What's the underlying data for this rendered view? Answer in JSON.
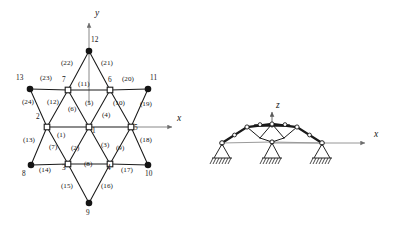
{
  "figure": {
    "title": "",
    "colors": {
      "line": "#1a1a1a",
      "node_fill_solid": "#141414",
      "node_fill_hollow": "#ffffff",
      "axis": "#6e6e6e",
      "background": "#ffffff"
    }
  },
  "left_diagram": {
    "name": "star-truss-plan-view",
    "axes": [
      {
        "id": "y-axis",
        "label": "y",
        "label_x": 96,
        "label_y": 14,
        "x1": 89,
        "y1": 105,
        "x2": 89,
        "y2": 22
      },
      {
        "id": "x-axis",
        "label": "x",
        "label_x": 180,
        "label_y": 120,
        "x1": 131,
        "y1": 127,
        "x2": 174,
        "y2": 127
      }
    ],
    "nodes": [
      {
        "id": "1",
        "x": 89,
        "y": 127,
        "type": "hollow",
        "label": "1",
        "label_x": 93,
        "label_y": 131
      },
      {
        "id": "2",
        "x": 47,
        "y": 127,
        "type": "hollow",
        "label": "2",
        "label_x": 38,
        "label_y": 119
      },
      {
        "id": "3",
        "x": 68,
        "y": 164,
        "type": "hollow",
        "label": "3",
        "label_x": 64,
        "label_y": 168
      },
      {
        "id": "4",
        "x": 110,
        "y": 164,
        "type": "hollow",
        "label": "4",
        "label_x": 109,
        "label_y": 168
      },
      {
        "id": "5",
        "x": 131,
        "y": 127,
        "type": "hollow",
        "label": "5",
        "label_x": 134,
        "label_y": 128
      },
      {
        "id": "6",
        "x": 110,
        "y": 90,
        "type": "hollow",
        "label": "6",
        "label_x": 110,
        "label_y": 80
      },
      {
        "id": "7",
        "x": 68,
        "y": 90,
        "type": "hollow",
        "label": "7",
        "label_x": 63,
        "label_y": 80
      },
      {
        "id": "8",
        "x": 31,
        "y": 165,
        "type": "solid",
        "label": "8",
        "label_x": 24,
        "label_y": 172
      },
      {
        "id": "9",
        "x": 89,
        "y": 203,
        "type": "solid",
        "label": "9",
        "label_x": 87,
        "label_y": 208
      },
      {
        "id": "10",
        "x": 148,
        "y": 165,
        "type": "solid",
        "label": "10",
        "label_x": 147,
        "label_y": 172
      },
      {
        "id": "11",
        "x": 148,
        "y": 89,
        "type": "solid",
        "label": "11",
        "label_x": 150,
        "label_y": 78
      },
      {
        "id": "12",
        "x": 89,
        "y": 51,
        "type": "solid",
        "label": "12",
        "label_x": 92,
        "label_y": 41
      },
      {
        "id": "13",
        "x": 30,
        "y": 89,
        "type": "solid",
        "label": "13",
        "label_x": 18,
        "label_y": 78
      }
    ],
    "members": [
      {
        "id": "1",
        "from": "1",
        "to": "2",
        "label": "(1)",
        "label_x": 60,
        "label_y": 132
      },
      {
        "id": "2",
        "from": "1",
        "to": "3",
        "label": "(2)",
        "label_x": 74,
        "label_y": 150
      },
      {
        "id": "3",
        "from": "1",
        "to": "4",
        "label": "(3)",
        "label_x": 104,
        "label_y": 147
      },
      {
        "id": "4",
        "from": "1",
        "to": "5",
        "label": "(4)",
        "label_x": 105,
        "label_y": 117
      },
      {
        "id": "5",
        "from": "1",
        "to": "6",
        "label": "(5)",
        "label_x": 88,
        "label_y": 105
      },
      {
        "id": "6",
        "from": "1",
        "to": "7",
        "label": "(6)",
        "label_x": 71,
        "label_y": 110
      },
      {
        "id": "7",
        "from": "2",
        "to": "3",
        "label": "(7)",
        "label_x": 52,
        "label_y": 148
      },
      {
        "id": "8",
        "from": "3",
        "to": "4",
        "label": "(8)",
        "label_x": 87,
        "label_y": 165
      },
      {
        "id": "9",
        "from": "4",
        "to": "5",
        "label": "(9)",
        "label_x": 119,
        "label_y": 150
      },
      {
        "id": "10",
        "from": "5",
        "to": "6",
        "label": "(10)",
        "label_x": 117,
        "label_y": 105
      },
      {
        "id": "11",
        "from": "6",
        "to": "7",
        "label": "(11)",
        "label_x": 82,
        "label_y": 85
      },
      {
        "id": "12",
        "from": "7",
        "to": "2",
        "label": "(12)",
        "label_x": 51,
        "label_y": 104
      },
      {
        "id": "13",
        "from": "2",
        "to": "8",
        "label": "(13)",
        "label_x": 27,
        "label_y": 141
      },
      {
        "id": "14",
        "from": "8",
        "to": "3",
        "label": "(14)",
        "label_x": 44,
        "label_y": 168
      },
      {
        "id": "15",
        "from": "3",
        "to": "9",
        "label": "(15)",
        "label_x": 66,
        "label_y": 186
      },
      {
        "id": "16",
        "from": "9",
        "to": "4",
        "label": "(16)",
        "label_x": 105,
        "label_y": 185
      },
      {
        "id": "17",
        "from": "4",
        "to": "10",
        "label": "(17)",
        "label_x": 126,
        "label_y": 168
      },
      {
        "id": "18",
        "from": "10",
        "to": "5",
        "label": "(18)",
        "label_x": 143,
        "label_y": 142
      },
      {
        "id": "19",
        "from": "5",
        "to": "11",
        "label": "(19)",
        "label_x": 143,
        "label_y": 106
      },
      {
        "id": "20",
        "from": "11",
        "to": "6",
        "label": "(20)",
        "label_x": 126,
        "label_y": 80
      },
      {
        "id": "21",
        "from": "6",
        "to": "12",
        "label": "(21)",
        "label_x": 104,
        "label_y": 64
      },
      {
        "id": "22",
        "from": "12",
        "to": "7",
        "label": "(22)",
        "label_x": 65,
        "label_y": 64
      },
      {
        "id": "23",
        "from": "7",
        "to": "13",
        "label": "(23)",
        "label_x": 44,
        "label_y": 79
      },
      {
        "id": "24",
        "from": "13",
        "to": "2",
        "label": "(24)",
        "label_x": 26,
        "label_y": 104
      }
    ]
  },
  "right_diagram": {
    "name": "truss-elevation-view",
    "axes": [
      {
        "id": "z-axis",
        "label": "z",
        "label_x": 277,
        "label_y": 104,
        "x1": 272,
        "y1": 126,
        "x2": 272,
        "y2": 112
      },
      {
        "id": "x-axis",
        "label": "x",
        "label_x": 378,
        "label_y": 136,
        "x1": 272,
        "y1": 143,
        "x2": 367,
        "y2": 143
      }
    ],
    "chords_top": [
      {
        "x": 222,
        "y": 143
      },
      {
        "x": 247,
        "y": 127
      },
      {
        "x": 272,
        "y": 124
      },
      {
        "x": 297,
        "y": 127
      },
      {
        "x": 322,
        "y": 143
      }
    ],
    "joint_nodes": [
      {
        "x": 222,
        "y": 143,
        "type": "hollow"
      },
      {
        "x": 247,
        "y": 127,
        "type": "hollow"
      },
      {
        "x": 260,
        "y": 124,
        "type": "hollow"
      },
      {
        "x": 272,
        "y": 124,
        "type": "hollow"
      },
      {
        "x": 285,
        "y": 124,
        "type": "hollow"
      },
      {
        "x": 297,
        "y": 127,
        "type": "hollow"
      },
      {
        "x": 322,
        "y": 143,
        "type": "hollow"
      }
    ],
    "supports": [
      {
        "id": "support-left",
        "x": 222,
        "y": 143
      },
      {
        "id": "support-center",
        "x": 272,
        "y": 143
      },
      {
        "id": "support-right",
        "x": 322,
        "y": 143
      }
    ]
  }
}
